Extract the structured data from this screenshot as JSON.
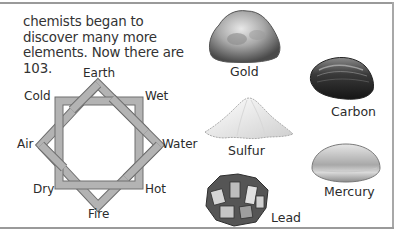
{
  "paragraph": {
    "text": "chemists began to discover many more elements. Now there are 103."
  },
  "diagram": {
    "labels": {
      "top": "Earth",
      "top_left": "Cold",
      "top_right": "Wet",
      "left": "Air",
      "right": "Water",
      "bottom_left": "Dry",
      "bottom_right": "Hot",
      "bottom": "Fire"
    },
    "colors": {
      "band_fill": "#b3b3b3",
      "band_stroke": "#6e6e6e"
    }
  },
  "specimens": [
    {
      "name": "Gold",
      "icon": "gold-nugget-icon"
    },
    {
      "name": "Carbon",
      "icon": "carbon-lump-icon"
    },
    {
      "name": "Sulfur",
      "icon": "sulfur-pile-icon"
    },
    {
      "name": "Mercury",
      "icon": "mercury-drop-icon"
    },
    {
      "name": "Lead",
      "icon": "lead-crystal-icon"
    }
  ]
}
